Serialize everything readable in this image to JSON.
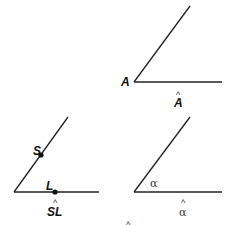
{
  "diagram": {
    "angle_a": {
      "vertex_label": "A",
      "caption_base": "A",
      "caption_hat": "^"
    },
    "angle_sl": {
      "point_s_label": "S",
      "point_l_label": "L",
      "caption_base": "SL",
      "caption_hat": "^"
    },
    "angle_alpha": {
      "angle_label": "α",
      "caption_base": "α",
      "caption_hat": "^"
    },
    "stray_hat": "^",
    "colors": {
      "line": "#222222",
      "point": "#111111"
    }
  }
}
